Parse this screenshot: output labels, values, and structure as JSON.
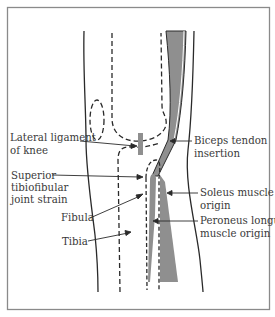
{
  "figure": {
    "colors": {
      "line": "#2a2a2a",
      "muscle_fill": "#8f8f8f",
      "frame": "#8a8a8a",
      "background": "#ffffff"
    },
    "labels": {
      "lateral_ligament": [
        "Lateral ligament",
        "of knee"
      ],
      "biceps_tendon": [
        "Biceps tendon",
        "insertion"
      ],
      "superior_joint": [
        "Superior",
        "tibiofibular",
        "joint strain"
      ],
      "fibula": "Fibula",
      "tibia": "Tibia",
      "soleus": [
        "Soleus muscle",
        "origin"
      ],
      "peroneus": [
        "Peroneus longus",
        "muscle origin"
      ]
    }
  }
}
